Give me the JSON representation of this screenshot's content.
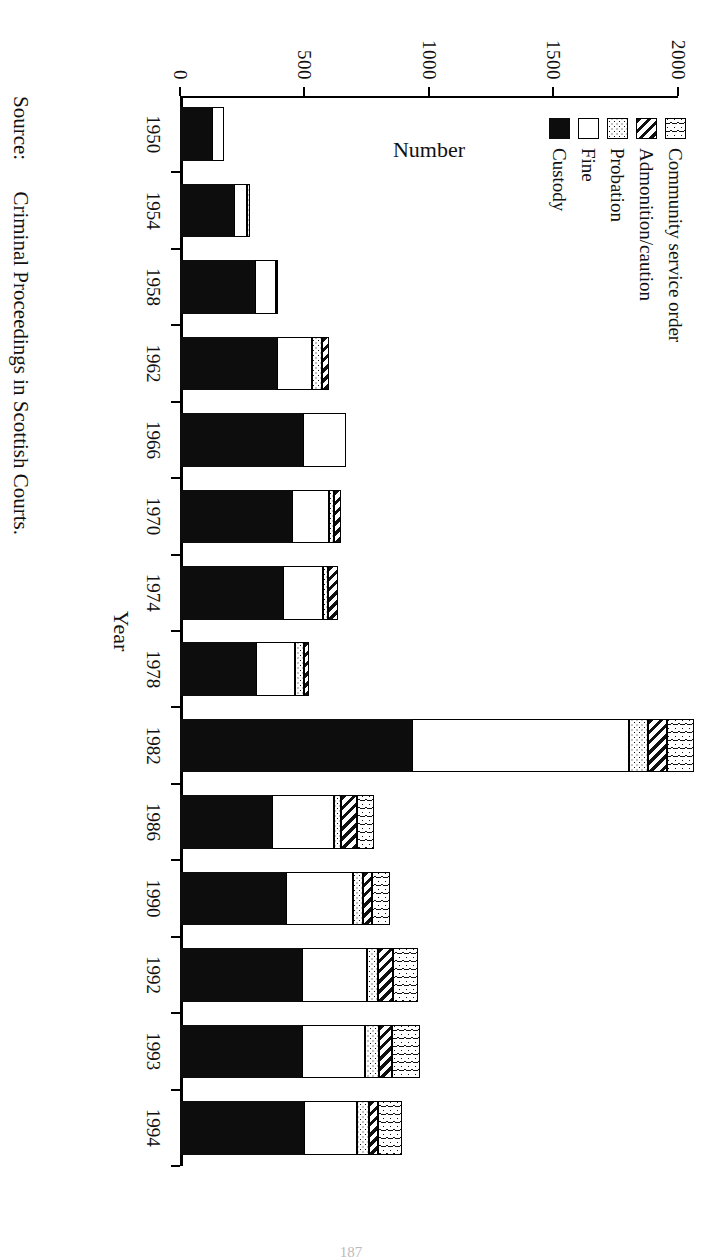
{
  "figure": {
    "source_label": "Source:",
    "source_text": "Criminal Proceedings in Scottish Courts.",
    "page_number": "187"
  },
  "legend": {
    "items": [
      {
        "label": "Community service order",
        "key": "cso",
        "pattern": "wavy-hatch"
      },
      {
        "label": "Admonition/caution",
        "key": "admonition",
        "pattern": "diagonal-hatch"
      },
      {
        "label": "Probation",
        "key": "probation",
        "pattern": "dotted"
      },
      {
        "label": "Fine",
        "key": "fine",
        "pattern": "solid-white"
      },
      {
        "label": "Custody",
        "key": "custody",
        "pattern": "solid-black"
      }
    ]
  },
  "chart_data": {
    "type": "bar",
    "title": "",
    "xlabel": "Year",
    "ylabel": "Number",
    "ylim": [
      0,
      2000
    ],
    "yticks": [
      0,
      500,
      1000,
      1500,
      2000
    ],
    "grid": false,
    "legend_position": "top-left",
    "stacked": true,
    "categories": [
      "1950",
      "1954",
      "1958",
      "1962",
      "1966",
      "1970",
      "1974",
      "1978",
      "1982",
      "1986",
      "1990",
      "1992",
      "1993",
      "1994"
    ],
    "series": [
      {
        "name": "Custody",
        "key": "custody",
        "values": [
          130,
          215,
          300,
          390,
          495,
          450,
          415,
          305,
          930,
          370,
          425,
          490,
          490,
          500
        ]
      },
      {
        "name": "Fine",
        "key": "fine",
        "values": [
          45,
          55,
          85,
          140,
          170,
          150,
          160,
          155,
          875,
          250,
          270,
          260,
          255,
          210
        ]
      },
      {
        "name": "Probation",
        "key": "probation",
        "values": [
          0,
          12,
          10,
          40,
          0,
          20,
          20,
          40,
          75,
          25,
          40,
          45,
          55,
          50
        ]
      },
      {
        "name": "Admonition/caution",
        "key": "admonition",
        "values": [
          0,
          0,
          0,
          30,
          0,
          25,
          40,
          20,
          75,
          65,
          35,
          60,
          50,
          35
        ]
      },
      {
        "name": "Community service order",
        "key": "cso",
        "values": [
          0,
          0,
          0,
          0,
          0,
          0,
          0,
          0,
          110,
          70,
          75,
          100,
          115,
          95
        ]
      }
    ],
    "totals": [
      175,
      282,
      395,
      600,
      665,
      645,
      635,
      520,
      2065,
      780,
      845,
      955,
      965,
      890
    ]
  }
}
